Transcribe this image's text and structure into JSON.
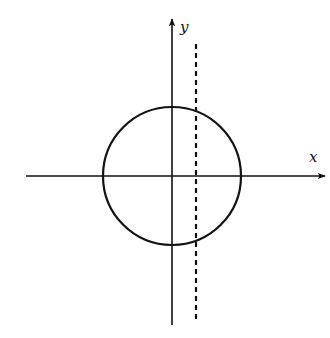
{
  "diagram": {
    "type": "coordinate-plane",
    "colors": {
      "stroke": "#111111",
      "background": "#ffffff"
    },
    "axes": {
      "x": {
        "label": "x",
        "from": [
          26,
          176
        ],
        "to": [
          325,
          176
        ]
      },
      "y": {
        "label": "y",
        "from": [
          172,
          325
        ],
        "to": [
          172,
          19
        ]
      }
    },
    "circle": {
      "cx": 172,
      "cy": 176,
      "r": 69
    },
    "dashed_line": {
      "x": 196,
      "y1": 44,
      "y2": 322,
      "dash": "5 4"
    }
  }
}
